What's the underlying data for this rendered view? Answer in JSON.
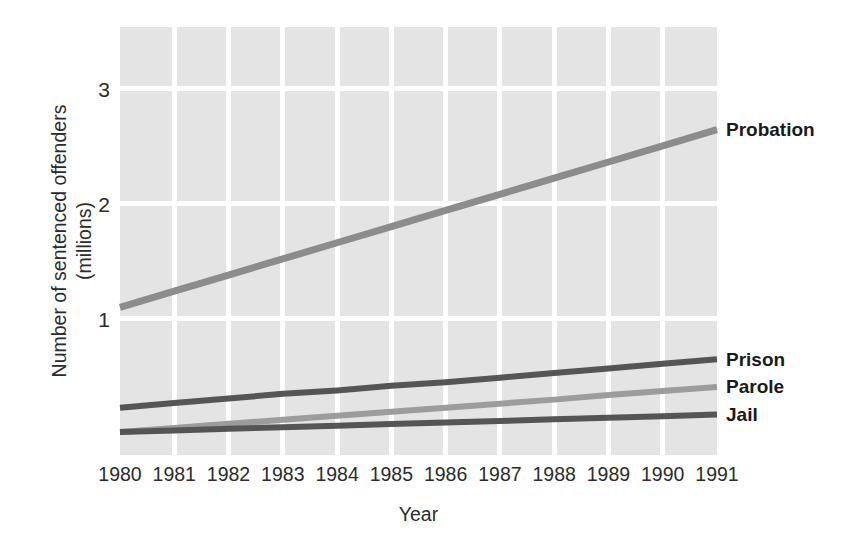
{
  "chart_data": {
    "type": "line",
    "title": "",
    "xlabel": "Year",
    "ylabel": "Number of sentenced offenders (millions)",
    "ylabel_lines": [
      "Number of sentenced offenders",
      "(millions)"
    ],
    "categories": [
      "1980",
      "1981",
      "1982",
      "1983",
      "1984",
      "1985",
      "1986",
      "1987",
      "1988",
      "1989",
      "1990",
      "1991"
    ],
    "x": [
      1980,
      1981,
      1982,
      1983,
      1984,
      1985,
      1986,
      1987,
      1988,
      1989,
      1990,
      1991
    ],
    "xlim": [
      1980,
      1991
    ],
    "ylim": [
      -0.18,
      3.53
    ],
    "yticks": [
      1,
      2,
      3
    ],
    "ytick_labels": [
      "1",
      "2",
      "3"
    ],
    "grid": true,
    "grid_color": "#ffffff",
    "panel_color": "#e4e4e4",
    "legend_position": "right-inline",
    "series": [
      {
        "name": "Probation",
        "color": "#8c8c8c",
        "values": [
          1.1,
          1.24,
          1.38,
          1.52,
          1.66,
          1.8,
          1.94,
          2.08,
          2.22,
          2.36,
          2.5,
          2.64
        ]
      },
      {
        "name": "Prison",
        "color": "#555555",
        "values": [
          0.23,
          0.27,
          0.31,
          0.35,
          0.38,
          0.42,
          0.45,
          0.49,
          0.53,
          0.57,
          0.61,
          0.65
        ]
      },
      {
        "name": "Parole",
        "color": "#9c9c9c",
        "values": [
          0.02,
          0.055,
          0.09,
          0.125,
          0.16,
          0.195,
          0.23,
          0.265,
          0.3,
          0.34,
          0.375,
          0.41
        ]
      },
      {
        "name": "Jail",
        "color": "#555555",
        "values": [
          0.02,
          0.033,
          0.047,
          0.06,
          0.074,
          0.088,
          0.101,
          0.115,
          0.129,
          0.142,
          0.156,
          0.17
        ]
      }
    ]
  }
}
